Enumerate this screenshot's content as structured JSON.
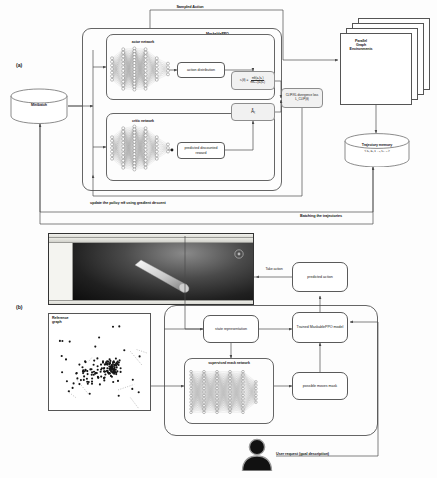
{
  "figure": {
    "panel_a_tag": "(a)",
    "panel_b_tag": "(b)"
  },
  "panel_a": {
    "sampled_action_label": "Sampled Action",
    "algorithm_label": "MaskablePPO",
    "minibatch_label": "Minibatch",
    "actor_network_label": "actor network",
    "critic_network_label": "critic network",
    "action_distribution_label": "action distribution",
    "predicted_reward_label": "predicted discounted\nreward",
    "ratio_formula_lhs": "rₜ(θ) =",
    "ratio_formula_num": "πθ(aₜ|sₜ)",
    "ratio_formula_den": "πθₒₗₑ(aₜ|sₜ)",
    "advantage_label": "Âₜ",
    "loss_label": "CLIP/KL divergence\nloss L_CLIP(θ)",
    "parallel_env_label": "Parallel\nGraph\nEnvironments",
    "trajectory_memory_label": "Trajectory memory",
    "trajectory_tuple_label": "<  sₜ, aₜ, rₜ ₊₁, sₜ ₊₁  >",
    "update_policy_label": "update the policy πθ using gradient descent",
    "batching_label": "Batching the trajectories"
  },
  "panel_b": {
    "take_action_label": "Take action",
    "predicted_action_label": "predicted action",
    "state_representation_label": "state representation",
    "trained_model_label": "Trained MaskablePPO\nmodel",
    "supervised_mask_label": "supervised mask network",
    "possible_moves_label": "possible moves mask",
    "reference_graph_label": "Reference\ngraph",
    "user_request_label": "User request (goal description)"
  },
  "colors": {
    "line": "#5a5a5a",
    "box_fill": "#ffffff",
    "shade_fill": "#f1f1f1",
    "text": "#161616",
    "node": "#1b1b1b"
  }
}
